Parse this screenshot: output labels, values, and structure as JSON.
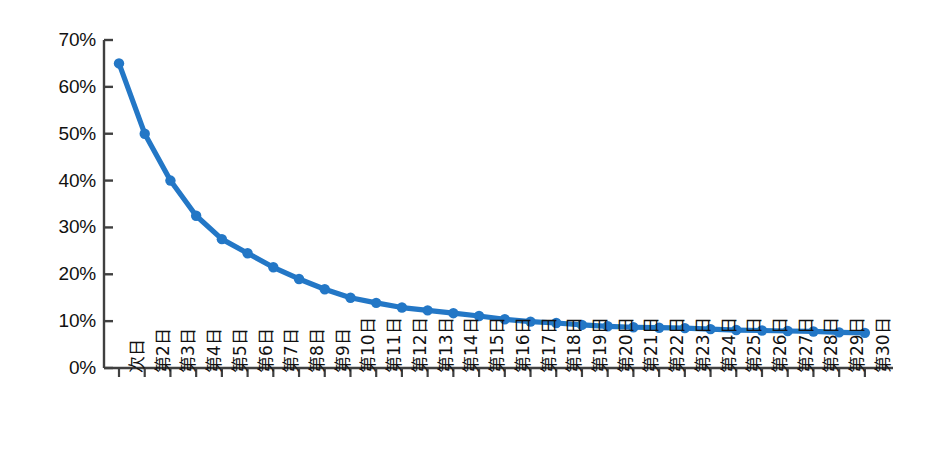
{
  "chart_data": {
    "type": "line",
    "title": "",
    "subtitle": "",
    "xlabel": "",
    "ylabel": "",
    "ylim": [
      0,
      70
    ],
    "yticks": [
      0,
      10,
      20,
      30,
      40,
      50,
      60,
      70
    ],
    "ytick_labels": [
      "0%",
      "10%",
      "20%",
      "30%",
      "40%",
      "50%",
      "60%",
      "70%"
    ],
    "grid": false,
    "legend": false,
    "legend_position": "none",
    "marker": "circle",
    "line_color": "#2377C6",
    "marker_color": "#2377C6",
    "categories": [
      "次日",
      "第2日",
      "第3日",
      "第4日",
      "第5日",
      "第6日",
      "第7日",
      "第8日",
      "第9日",
      "第10日",
      "第11日",
      "第12日",
      "第13日",
      "第14日",
      "第15日",
      "第16日",
      "第17日",
      "第18日",
      "第19日",
      "第20日",
      "第21日",
      "第22日",
      "第23日",
      "第24日",
      "第25日",
      "第26日",
      "第27日",
      "第28日",
      "第29日",
      "第30日"
    ],
    "values": [
      65.0,
      50.0,
      40.0,
      32.5,
      27.5,
      24.5,
      21.5,
      19.0,
      16.8,
      15.0,
      13.9,
      12.9,
      12.3,
      11.7,
      11.1,
      10.4,
      9.9,
      9.6,
      9.2,
      8.9,
      8.7,
      8.6,
      8.5,
      8.3,
      8.1,
      8.0,
      7.9,
      7.8,
      7.6,
      7.5
    ],
    "series": [
      {
        "name": "留存率",
        "values": [
          65.0,
          50.0,
          40.0,
          32.5,
          27.5,
          24.5,
          21.5,
          19.0,
          16.8,
          15.0,
          13.9,
          12.9,
          12.3,
          11.7,
          11.1,
          10.4,
          9.9,
          9.6,
          9.2,
          8.9,
          8.7,
          8.6,
          8.5,
          8.3,
          8.1,
          8.0,
          7.9,
          7.8,
          7.6,
          7.5
        ]
      }
    ]
  },
  "axis": {
    "line_color": "#404040"
  }
}
